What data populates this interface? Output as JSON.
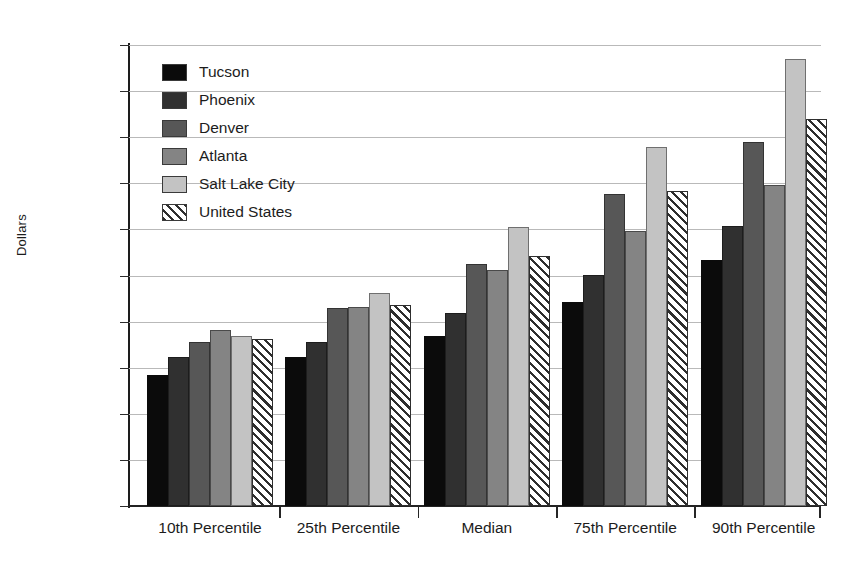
{
  "chart_data": {
    "type": "bar",
    "title": "",
    "xlabel": "",
    "ylabel": "Dollars",
    "ylim": [
      0,
      100000
    ],
    "ytick_values": [
      0,
      10000,
      20000,
      30000,
      40000,
      50000,
      60000,
      70000,
      80000,
      90000,
      100000
    ],
    "ytick_labels": [
      "0",
      "10,000",
      "20,000",
      "30,000",
      "40,000",
      "50,000",
      "60,000",
      "70,000",
      "80,000",
      "90,000",
      "100,000"
    ],
    "grid": true,
    "legend_position": "upper-left-inside",
    "categories": [
      "10th Percentile",
      "25th Percentile",
      "Median",
      "75th Percentile",
      "90th Percentile"
    ],
    "series": [
      {
        "name": "Tucson",
        "swatch": "solid-black",
        "color": "#0b0b0b",
        "values": [
          28500,
          32300,
          36800,
          44200,
          53300
        ]
      },
      {
        "name": "Phoenix",
        "swatch": "solid-dark-gray",
        "color": "#303030",
        "values": [
          32400,
          35600,
          41800,
          50100,
          60700
        ]
      },
      {
        "name": "Denver",
        "swatch": "solid-medium-gray",
        "color": "#575757",
        "values": [
          35600,
          42900,
          52600,
          67600,
          79000
        ]
      },
      {
        "name": "Atlanta",
        "swatch": "solid-gray",
        "color": "#848484",
        "values": [
          38100,
          43200,
          51300,
          59700,
          69700
        ]
      },
      {
        "name": "Salt Lake City",
        "swatch": "solid-light-gray",
        "color": "#c3c3c3",
        "values": [
          36900,
          46100,
          60500,
          77800,
          97000
        ]
      },
      {
        "name": "United States",
        "swatch": "diagonal-hatch",
        "color": "#ffffff",
        "values": [
          36200,
          43500,
          54200,
          68400,
          84000
        ]
      }
    ]
  }
}
